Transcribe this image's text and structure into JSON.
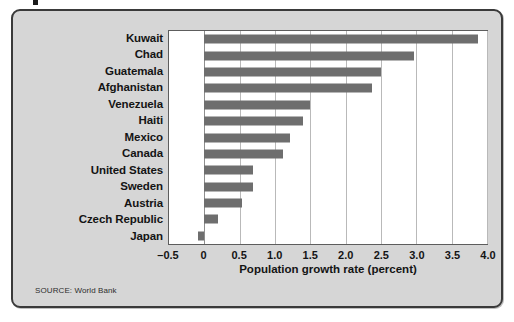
{
  "figure": {
    "source_note": "SOURCE: World Bank",
    "background_color": "#d6d6d6",
    "bar_color": "#6e6e6e",
    "plot_background": "#ffffff",
    "border_color": "#3a3a3a"
  },
  "chart_data": {
    "type": "bar",
    "orientation": "horizontal",
    "title": "",
    "xlabel": "Population growth rate (percent)",
    "ylabel": "",
    "xlim": [
      -0.5,
      4.0
    ],
    "xticks": [
      "–0.5",
      "0",
      "0.5",
      "1.0",
      "1.5",
      "2.0",
      "2.5",
      "3.0",
      "3.5",
      "4.0"
    ],
    "xtick_values": [
      -0.5,
      0,
      0.5,
      1.0,
      1.5,
      2.0,
      2.5,
      3.0,
      3.5,
      4.0
    ],
    "grid": "vertical",
    "legend": "none",
    "categories": [
      "Kuwait",
      "Chad",
      "Guatemala",
      "Afghanistan",
      "Venezuela",
      "Haiti",
      "Mexico",
      "Canada",
      "United States",
      "Sweden",
      "Austria",
      "Czech Republic",
      "Japan"
    ],
    "values": [
      3.87,
      2.97,
      2.5,
      2.37,
      1.5,
      1.4,
      1.21,
      1.11,
      0.69,
      0.69,
      0.53,
      0.2,
      -0.09
    ]
  }
}
